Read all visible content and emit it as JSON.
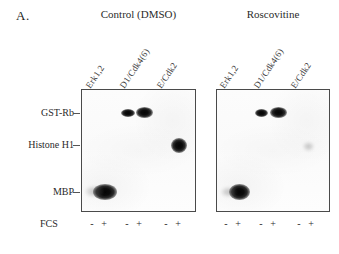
{
  "figure": {
    "panel_letter": "A.",
    "row_label_fcs": "FCS"
  },
  "groups": [
    {
      "title": "Control (DMSO)",
      "lanes": [
        {
          "label": "Erk1,2",
          "fcs": [
            "-",
            "+"
          ]
        },
        {
          "label": "D1/Cdk4(6)",
          "fcs": [
            "-",
            "+"
          ]
        },
        {
          "label": "E/Cdk2",
          "fcs": [
            "-",
            "+"
          ]
        }
      ]
    },
    {
      "title": "Roscovitine",
      "lanes": [
        {
          "label": "Erk1,2",
          "fcs": [
            "-",
            "+"
          ]
        },
        {
          "label": "D1/Cdk4(6)",
          "fcs": [
            "-",
            "+"
          ]
        },
        {
          "label": "E/Cdk2",
          "fcs": [
            "-",
            "+"
          ]
        }
      ]
    }
  ],
  "substrates": [
    {
      "label": "GST-Rb"
    },
    {
      "label": "Histone H1"
    },
    {
      "label": "MBP"
    }
  ],
  "colors": {
    "band": "#0a0a0a",
    "border": "#4a4a4a",
    "film": "#fbfbfb",
    "text": "#2b2b2b"
  }
}
